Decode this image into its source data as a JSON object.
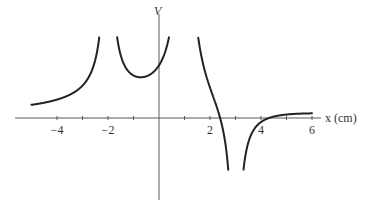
{
  "chart_data": {
    "type": "line",
    "title": "",
    "xlabel": "x (cm)",
    "ylabel": "V",
    "xlim": [
      -5,
      6
    ],
    "ylim": [
      -2.5,
      3.2
    ],
    "grid": false,
    "legend": null,
    "x_ticks": [
      -4,
      -3,
      -2,
      -1,
      0,
      1,
      2,
      3,
      4,
      5,
      6
    ],
    "x_tick_labels": [
      {
        "value": -4,
        "label": "−4"
      },
      {
        "value": -2,
        "label": "−2"
      },
      {
        "value": 2,
        "label": "2"
      },
      {
        "value": 4,
        "label": "4"
      },
      {
        "value": 6,
        "label": "6"
      }
    ],
    "asymptotes": [
      {
        "x": -2,
        "direction": "+infinity"
      },
      {
        "x": 1,
        "direction": "+infinity"
      },
      {
        "x": 3,
        "direction": "-infinity"
      }
    ],
    "charges": [
      {
        "x": -2,
        "q": 1
      },
      {
        "x": 1,
        "q": 2
      },
      {
        "x": 3,
        "q": -1
      }
    ],
    "annotations": [],
    "series": [
      {
        "name": "V(x)",
        "description": "Electric potential along x-axis from three point charges: positive at x=-2, positive at x=1, negative at x=3",
        "samples": [
          {
            "x": -5,
            "y": 0.08
          },
          {
            "x": -4,
            "y": 0.35
          },
          {
            "x": -3,
            "y": 0.85
          },
          {
            "x": -2.2,
            "y": 3.0
          },
          {
            "x": -1.8,
            "y": 3.0
          },
          {
            "x": -1,
            "y": 1.25
          },
          {
            "x": -0.6,
            "y": 1.15
          },
          {
            "x": 0,
            "y": 1.45
          },
          {
            "x": 0.6,
            "y": 3.0
          },
          {
            "x": 1.4,
            "y": 3.0
          },
          {
            "x": 2,
            "y": 1.2
          },
          {
            "x": 2.3,
            "y": 0.0
          },
          {
            "x": 2.8,
            "y": -3.0
          },
          {
            "x": 3.2,
            "y": -3.0
          },
          {
            "x": 4,
            "y": -0.45
          },
          {
            "x": 5,
            "y": -0.15
          },
          {
            "x": 6,
            "y": -0.08
          }
        ]
      }
    ]
  },
  "labels": {
    "y_axis": "V",
    "x_axis": "x (cm)"
  }
}
